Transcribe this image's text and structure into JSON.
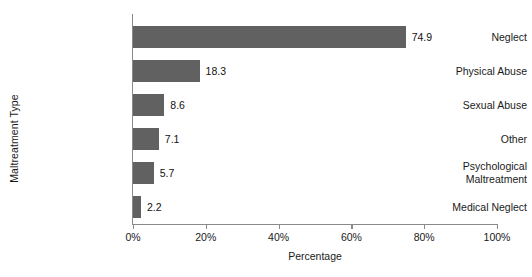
{
  "chart_data": {
    "type": "bar",
    "orientation": "horizontal",
    "title": "",
    "xlabel": "Percentage",
    "ylabel": "Maltreatment Type",
    "categories": [
      "Neglect",
      "Physical Abuse",
      "Sexual Abuse",
      "Other",
      "Psychological\nMaltreatment",
      "Medical Neglect"
    ],
    "values": [
      74.9,
      18.3,
      8.6,
      7.1,
      5.7,
      2.2
    ],
    "value_labels": [
      "74.9",
      "18.3",
      "8.6",
      "7.1",
      "5.7",
      "2.2"
    ],
    "xlim": [
      0,
      100
    ],
    "xticks": [
      0,
      20,
      40,
      60,
      80,
      100
    ],
    "xtick_labels": [
      "0%",
      "20%",
      "40%",
      "60%",
      "80%",
      "100%"
    ],
    "grid": false,
    "legend": false,
    "bar_color": "#616161",
    "axis_color": "#8a8a8a",
    "text_color": "#1a1a1a",
    "background": "#ffffff"
  }
}
